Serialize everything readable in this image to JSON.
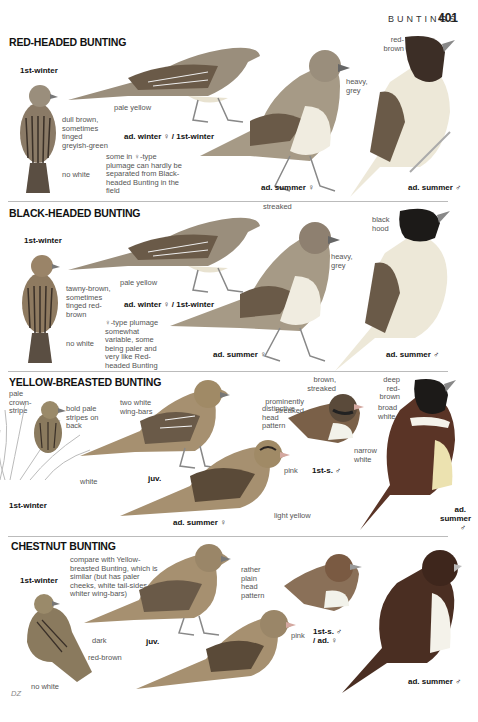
{
  "header": {
    "running_head": "BUNTINGS",
    "page_number": "401"
  },
  "sections": [
    {
      "title": "RED-HEADED BUNTING",
      "labels": {
        "age_1st_winter": "1st-winter",
        "note_dull_brown": "dull brown, sometimes tinged greyish-green",
        "note_no_white": "no white",
        "note_pale_yellow": "pale yellow",
        "age_ad_winter": "ad. winter ♀ / 1st-winter",
        "note_female_type": "some in ♀-type plumage can hardly be separated from Black-headed Bunting in the field",
        "note_heavy_grey": "heavy, grey",
        "age_ad_summer_f": "ad. summer ♀",
        "note_red_brown": "red-brown",
        "age_ad_summer_m": "ad. summer ♂"
      }
    },
    {
      "title": "BLACK-HEADED BUNTING",
      "labels": {
        "age_1st_winter": "1st-winter",
        "note_tawny": "tawny-brown, sometimes tinged red-brown",
        "note_no_white": "no white",
        "note_pale_yellow": "pale yellow",
        "age_ad_winter": "ad. winter ♀ / 1st-winter",
        "note_female_type": "♀-type plumage somewhat variable, some being paler and very like Red-headed Bunting",
        "note_streaked": "streaked",
        "note_heavy_grey": "heavy, grey",
        "age_ad_summer_f": "ad. summer ♀",
        "note_black_hood": "black hood",
        "age_ad_summer_m": "ad. summer ♂"
      }
    },
    {
      "title": "YELLOW-BREASTED BUNTING",
      "labels": {
        "note_crown_stripe": "pale crown-stripe",
        "note_bold_pale": "bold pale stripes on back",
        "note_white": "white",
        "age_1st_winter": "1st-winter",
        "note_two_wingbars": "two white wing-bars",
        "age_juv": "juv.",
        "note_head_pattern": "distinctive head pattern",
        "note_pink": "pink",
        "note_light_yellow": "light yellow",
        "age_ad_summer_f": "ad. summer ♀",
        "note_brown_streaked": "brown, streaked",
        "note_prominently": "prominently streaked",
        "note_narrow_white": "narrow white",
        "age_1st_s_m": "1st-s. ♂",
        "note_deep_red_brown": "deep red-brown",
        "note_broad_white": "broad white",
        "age_ad_summer_m": "ad. summer ♂"
      }
    },
    {
      "title": "CHESTNUT BUNTING",
      "labels": {
        "age_1st_winter": "1st-winter",
        "note_compare": "compare with Yellow-breasted Bunting, which is similar (but has paler cheeks, white tail-sides and whiter wing-bars)",
        "note_dark": "dark",
        "age_juv": "juv.",
        "note_red_brown": "red-brown",
        "note_no_white": "no white",
        "note_plain_head": "rather plain head pattern",
        "note_pink": "pink",
        "age_1st_s": "1st-s. ♂ / ad. ♀",
        "age_ad_summer_m": "ad. summer ♂"
      }
    }
  ],
  "footer": {
    "artist_initials": "DZ"
  },
  "colors": {
    "bird_brown": "#8a7a66",
    "bird_dark": "#2b2622",
    "bird_grey": "#9a958c",
    "rule": "#bbbbbb"
  }
}
